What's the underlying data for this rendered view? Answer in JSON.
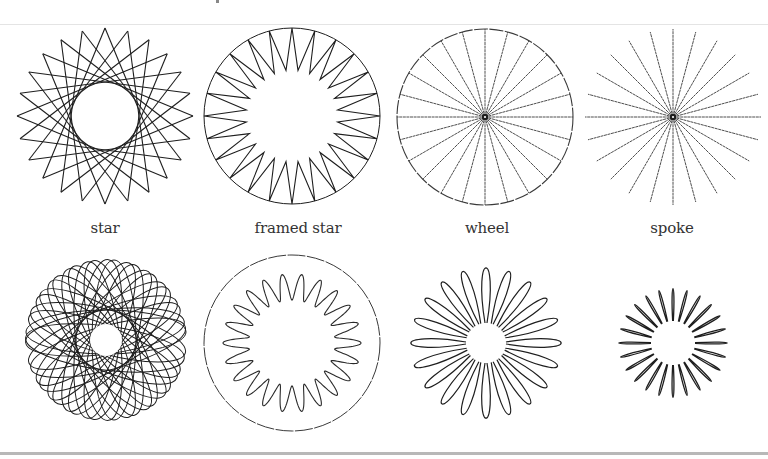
{
  "patterns": [
    {
      "id": "star",
      "label": "star",
      "type": "star",
      "points": 24,
      "row": 1,
      "col": 1
    },
    {
      "id": "framed-star",
      "label": "framed star",
      "type": "framed-star",
      "points": 24,
      "row": 1,
      "col": 2
    },
    {
      "id": "wheel",
      "label": "wheel",
      "type": "wheel",
      "spokes": 24,
      "row": 1,
      "col": 3
    },
    {
      "id": "spoke",
      "label": "spoke",
      "type": "spoke",
      "spokes": 24,
      "row": 1,
      "col": 4
    },
    {
      "id": "looped-star",
      "label": "",
      "type": "looped-star",
      "petals": 24,
      "row": 2,
      "col": 1
    },
    {
      "id": "framed-wave",
      "label": "",
      "type": "framed-wave",
      "waves": 22,
      "row": 2,
      "col": 2
    },
    {
      "id": "daisy",
      "label": "",
      "type": "daisy",
      "petals": 20,
      "row": 2,
      "col": 3
    },
    {
      "id": "burst",
      "label": "",
      "type": "burst",
      "petals": 24,
      "row": 2,
      "col": 4
    }
  ],
  "colors": {
    "ink": "#1e1e1e",
    "label": "#333333",
    "rule": "#b8b8b8"
  }
}
